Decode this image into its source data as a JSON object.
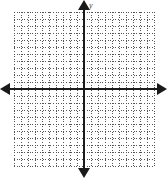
{
  "figure": {
    "name": "blank-cartesian-coordinate-grid",
    "title": "",
    "background_color": "#ffffff"
  },
  "chart_data": {
    "type": "scatter",
    "title": "",
    "subtitle": "",
    "xlabel": "",
    "ylabel": "y",
    "annotations": [],
    "series": [],
    "x": [],
    "values": [],
    "categories": [],
    "xlim": [
      -10,
      10
    ],
    "ylim": [
      -11,
      11
    ],
    "xtick_labels": [],
    "ytick_labels": [],
    "grid": true,
    "grid_style": "dotted",
    "grid_color": "#555555",
    "grid_spacing_px": 7,
    "grid_columns": 20,
    "grid_rows": 22,
    "legend": false,
    "legend_position": "none",
    "axes": {
      "x_axis": {
        "visible": true,
        "color": "#1a1a1a",
        "arrow_left": true,
        "arrow_right": true,
        "label": ""
      },
      "y_axis": {
        "visible": true,
        "color": "#1a1a1a",
        "arrow_up": true,
        "arrow_down": true,
        "label": "y"
      }
    },
    "origin": {
      "x_px": 84,
      "y_px": 89
    }
  },
  "labels": {
    "y_axis_label": "y",
    "x_axis_label": ""
  }
}
